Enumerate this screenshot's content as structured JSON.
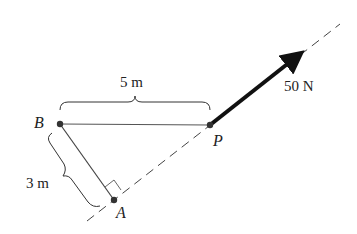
{
  "diagram": {
    "points": {
      "B": {
        "label": "B",
        "x": 60,
        "y": 124
      },
      "P": {
        "label": "P",
        "x": 210,
        "y": 125
      },
      "A": {
        "label": "A",
        "x": 114,
        "y": 200
      }
    },
    "dimensions": {
      "BP": {
        "label": "5 m"
      },
      "BA": {
        "label": "3 m"
      }
    },
    "force": {
      "label": "50 N",
      "direction": "along line of action from P, up-right"
    },
    "colors": {
      "ink": "#222222",
      "line": "#555555",
      "background": "#ffffff"
    }
  }
}
